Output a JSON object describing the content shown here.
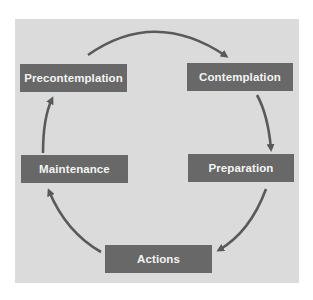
{
  "diagram": {
    "type": "cycle",
    "colors": {
      "page_background": "#ffffff",
      "panel_background": "#dbdbdb",
      "box_fill": "#686868",
      "box_text": "#f4f4f4",
      "arrow": "#5a5a5a"
    },
    "stages": [
      {
        "id": "precontemplation",
        "label": "Precontemplation"
      },
      {
        "id": "contemplation",
        "label": "Contemplation"
      },
      {
        "id": "preparation",
        "label": "Preparation"
      },
      {
        "id": "actions",
        "label": "Actions"
      },
      {
        "id": "maintenance",
        "label": "Maintenance"
      }
    ],
    "edges": [
      {
        "from": "precontemplation",
        "to": "contemplation"
      },
      {
        "from": "contemplation",
        "to": "preparation"
      },
      {
        "from": "preparation",
        "to": "actions"
      },
      {
        "from": "actions",
        "to": "maintenance"
      },
      {
        "from": "maintenance",
        "to": "precontemplation"
      }
    ]
  }
}
